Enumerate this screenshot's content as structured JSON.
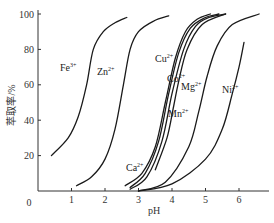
{
  "chart_data": {
    "type": "line",
    "title": "",
    "xlabel": "pH",
    "ylabel": "萃取率/%",
    "xlim": [
      0,
      7
    ],
    "ylim": [
      0,
      100
    ],
    "x_ticks": [
      "0",
      "1",
      "2",
      "3",
      "4",
      "5",
      "6"
    ],
    "y_ticks": [
      "20",
      "40",
      "60",
      "80",
      "100"
    ],
    "grid": false,
    "legend": "inline labels",
    "series": [
      {
        "name": "Fe3+",
        "label": "Fe",
        "charge": "3+",
        "points": [
          [
            0.4,
            20
          ],
          [
            0.9,
            30
          ],
          [
            1.2,
            42
          ],
          [
            1.45,
            60
          ],
          [
            1.65,
            80
          ],
          [
            1.95,
            90
          ],
          [
            2.3,
            95
          ],
          [
            2.65,
            98
          ]
        ]
      },
      {
        "name": "Zn2+",
        "label": "Zn",
        "charge": "2+",
        "points": [
          [
            1.15,
            3
          ],
          [
            1.6,
            8
          ],
          [
            2.0,
            18
          ],
          [
            2.3,
            35
          ],
          [
            2.55,
            60
          ],
          [
            2.75,
            80
          ],
          [
            3.0,
            90
          ],
          [
            3.45,
            96
          ],
          [
            3.9,
            99
          ]
        ]
      },
      {
        "name": "Ca2+",
        "label": "Ca",
        "charge": "2+",
        "points": [
          [
            2.6,
            3
          ],
          [
            3.1,
            10
          ],
          [
            3.5,
            25
          ],
          [
            3.8,
            50
          ],
          [
            4.1,
            75
          ],
          [
            4.4,
            90
          ],
          [
            4.75,
            97
          ],
          [
            5.15,
            100
          ]
        ]
      },
      {
        "name": "Cu2+",
        "label": "Cu",
        "charge": "2+",
        "points": [
          [
            2.75,
            2
          ],
          [
            3.2,
            10
          ],
          [
            3.6,
            28
          ],
          [
            3.9,
            55
          ],
          [
            4.2,
            78
          ],
          [
            4.55,
            92
          ],
          [
            5.0,
            98
          ],
          [
            5.4,
            100
          ]
        ]
      },
      {
        "name": "Mn2+",
        "label": "Mn",
        "charge": "2+",
        "points": [
          [
            2.75,
            1
          ],
          [
            3.25,
            8
          ],
          [
            3.7,
            28
          ],
          [
            4.0,
            55
          ],
          [
            4.35,
            80
          ],
          [
            4.7,
            93
          ],
          [
            5.1,
            98
          ],
          [
            5.6,
            100
          ]
        ]
      },
      {
        "name": "Co2+",
        "label": "Co",
        "charge": "2+",
        "points": [
          [
            3.5,
            12
          ],
          [
            3.85,
            30
          ],
          [
            4.05,
            48
          ],
          [
            4.2,
            62
          ],
          [
            4.45,
            80
          ],
          [
            4.9,
            94
          ],
          [
            5.6,
            100
          ]
        ]
      },
      {
        "name": "Mg2+",
        "label": "Mg",
        "charge": "2+",
        "points": [
          [
            3.0,
            0
          ],
          [
            3.8,
            5
          ],
          [
            4.5,
            25
          ],
          [
            4.8,
            45
          ],
          [
            5.05,
            65
          ],
          [
            5.35,
            82
          ],
          [
            5.8,
            94
          ],
          [
            6.6,
            100
          ]
        ]
      },
      {
        "name": "Ni2+",
        "label": "Ni",
        "charge": "2+",
        "points": [
          [
            3.0,
            0
          ],
          [
            4.0,
            4
          ],
          [
            5.0,
            18
          ],
          [
            5.5,
            35
          ],
          [
            5.8,
            55
          ],
          [
            6.0,
            70
          ],
          [
            6.15,
            84
          ]
        ]
      }
    ]
  },
  "labels": {
    "xlabel": "pH",
    "ylabel": "萃取率/%",
    "origin": "0"
  }
}
